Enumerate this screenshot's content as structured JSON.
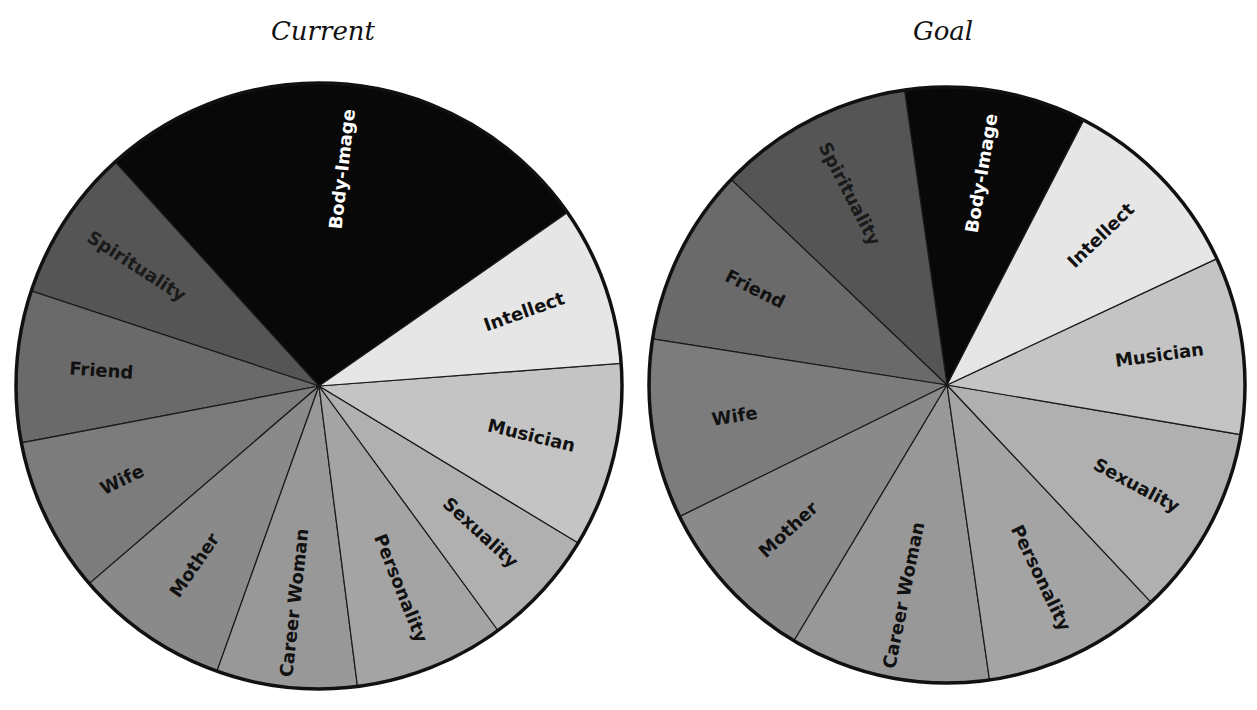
{
  "chart_data": [
    {
      "type": "pie",
      "title": "Current",
      "center": [
        319,
        386
      ],
      "radius": 303,
      "slices": [
        {
          "label": "Body-Image",
          "start_deg": 34.9,
          "end_deg": 132.3,
          "percent": 27.1,
          "color": "#080808",
          "text_color": "#ffffff"
        },
        {
          "label": "Spirituality",
          "start_deg": 132.3,
          "end_deg": 161.7,
          "percent": 8.2,
          "color": "#555555",
          "text_color": "#1a1a1a"
        },
        {
          "label": "Friend",
          "start_deg": 161.7,
          "end_deg": 190.8,
          "percent": 8.1,
          "color": "#6a6a6a",
          "text_color": "#111111"
        },
        {
          "label": "Wife",
          "start_deg": 190.8,
          "end_deg": 220.7,
          "percent": 8.3,
          "color": "#7c7c7c",
          "text_color": "#111111"
        },
        {
          "label": "Mother",
          "start_deg": 220.7,
          "end_deg": 250.3,
          "percent": 8.2,
          "color": "#8a8a8a",
          "text_color": "#111111"
        },
        {
          "label": "Career Woman",
          "start_deg": 250.3,
          "end_deg": 277.3,
          "percent": 7.5,
          "color": "#989898",
          "text_color": "#111111"
        },
        {
          "label": "Personality",
          "start_deg": 277.3,
          "end_deg": 306.2,
          "percent": 8.0,
          "color": "#a4a4a4",
          "text_color": "#111111"
        },
        {
          "label": "Sexuality",
          "start_deg": 306.2,
          "end_deg": 328.8,
          "percent": 6.3,
          "color": "#b0b0b0",
          "text_color": "#111111"
        },
        {
          "label": "Musician",
          "start_deg": 328.8,
          "end_deg": 364.3,
          "percent": 9.9,
          "color": "#c4c4c4",
          "text_color": "#111111"
        },
        {
          "label": "Intellect",
          "start_deg": 4.3,
          "end_deg": 34.9,
          "percent": 8.5,
          "color": "#e6e6e6",
          "text_color": "#111111"
        }
      ]
    },
    {
      "type": "pie",
      "title": "Goal",
      "center": [
        947,
        385
      ],
      "radius": 298,
      "slices": [
        {
          "label": "Body-Image",
          "start_deg": 62.7,
          "end_deg": 98.2,
          "percent": 9.9,
          "color": "#080808",
          "text_color": "#ffffff"
        },
        {
          "label": "Spirituality",
          "start_deg": 98.2,
          "end_deg": 136.4,
          "percent": 10.6,
          "color": "#555555",
          "text_color": "#1a1a1a"
        },
        {
          "label": "Friend",
          "start_deg": 136.4,
          "end_deg": 171.1,
          "percent": 9.6,
          "color": "#6a6a6a",
          "text_color": "#111111"
        },
        {
          "label": "Wife",
          "start_deg": 171.1,
          "end_deg": 206.2,
          "percent": 9.8,
          "color": "#7c7c7c",
          "text_color": "#111111"
        },
        {
          "label": "Mother",
          "start_deg": 206.2,
          "end_deg": 239.1,
          "percent": 9.1,
          "color": "#8a8a8a",
          "text_color": "#111111"
        },
        {
          "label": "Career Woman",
          "start_deg": 239.1,
          "end_deg": 278.2,
          "percent": 10.9,
          "color": "#989898",
          "text_color": "#111111"
        },
        {
          "label": "Personality",
          "start_deg": 278.2,
          "end_deg": 313.2,
          "percent": 9.7,
          "color": "#a4a4a4",
          "text_color": "#111111"
        },
        {
          "label": "Sexuality",
          "start_deg": 313.2,
          "end_deg": 350.4,
          "percent": 10.3,
          "color": "#b0b0b0",
          "text_color": "#111111"
        },
        {
          "label": "Musician",
          "start_deg": 350.4,
          "end_deg": 385.1,
          "percent": 9.6,
          "color": "#c4c4c4",
          "text_color": "#111111"
        },
        {
          "label": "Intellect",
          "start_deg": 25.1,
          "end_deg": 62.7,
          "percent": 10.4,
          "color": "#e6e6e6",
          "text_color": "#111111"
        }
      ]
    }
  ],
  "titles": {
    "current": "Current",
    "goal": "Goal"
  }
}
